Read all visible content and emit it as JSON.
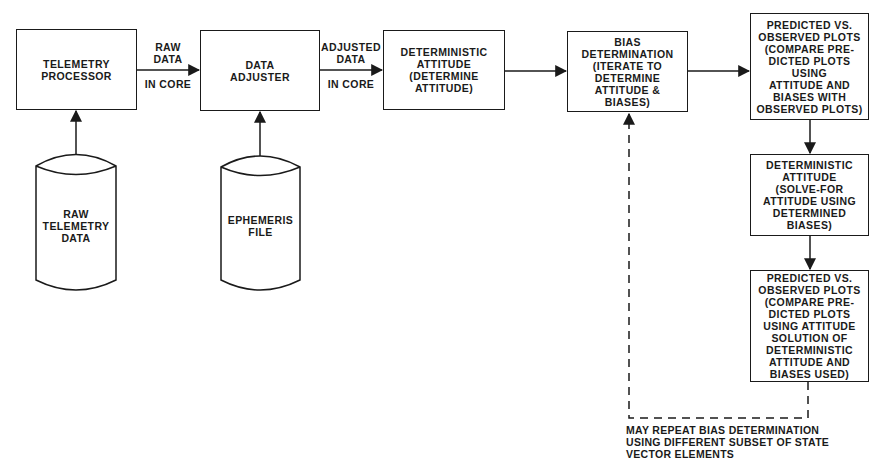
{
  "diagram": {
    "type": "flowchart",
    "nodes": [
      {
        "id": "telemetry_processor",
        "shape": "rect",
        "lines": [
          "TELEMETRY",
          "PROCESSOR"
        ]
      },
      {
        "id": "data_adjuster",
        "shape": "rect",
        "lines": [
          "DATA",
          "ADJUSTER"
        ]
      },
      {
        "id": "deterministic_attitude_1",
        "shape": "rect",
        "lines": [
          "DETERMINISTIC",
          "ATTITUDE",
          "(DETERMINE",
          "ATTITUDE)"
        ]
      },
      {
        "id": "bias_determination",
        "shape": "rect",
        "lines": [
          "BIAS",
          "DETERMINATION",
          "(ITERATE TO",
          "DETERMINE",
          "ATTITUDE &",
          "BIASES)"
        ]
      },
      {
        "id": "predicted_vs_observed_1",
        "shape": "rect",
        "lines": [
          "PREDICTED VS.",
          "OBSERVED PLOTS",
          "(COMPARE PRE-",
          "DICTED PLOTS",
          "USING",
          "ATTITUDE AND",
          "BIASES WITH",
          "OBSERVED PLOTS)"
        ]
      },
      {
        "id": "deterministic_attitude_2",
        "shape": "rect",
        "lines": [
          "DETERMINISTIC",
          "ATTITUDE",
          "(SOLVE-FOR",
          "ATTITUDE USING",
          "DETERMINED",
          "BIASES)"
        ]
      },
      {
        "id": "predicted_vs_observed_2",
        "shape": "rect",
        "lines": [
          "PREDICTED VS.",
          "OBSERVED PLOTS",
          "(COMPARE PRE-",
          "DICTED PLOTS",
          "USING ATTITUDE",
          "SOLUTION OF",
          "DETERMINISTIC",
          "ATTITUDE AND",
          "BIASES USED)"
        ]
      },
      {
        "id": "raw_telemetry_data",
        "shape": "cylinder",
        "lines": [
          "RAW",
          "TELEMETRY",
          "DATA"
        ]
      },
      {
        "id": "ephemeris_file",
        "shape": "cylinder",
        "lines": [
          "EPHEMERIS",
          "FILE"
        ]
      }
    ],
    "edges": [
      {
        "from": "telemetry_processor",
        "to": "data_adjuster",
        "label_above": [
          "RAW",
          "DATA"
        ],
        "label_below": "IN CORE"
      },
      {
        "from": "data_adjuster",
        "to": "deterministic_attitude_1",
        "label_above": [
          "ADJUSTED",
          "DATA"
        ],
        "label_below": "IN CORE"
      },
      {
        "from": "deterministic_attitude_1",
        "to": "bias_determination"
      },
      {
        "from": "bias_determination",
        "to": "predicted_vs_observed_1"
      },
      {
        "from": "predicted_vs_observed_1",
        "to": "deterministic_attitude_2"
      },
      {
        "from": "deterministic_attitude_2",
        "to": "predicted_vs_observed_2"
      },
      {
        "from": "raw_telemetry_data",
        "to": "telemetry_processor"
      },
      {
        "from": "ephemeris_file",
        "to": "data_adjuster"
      },
      {
        "from": "predicted_vs_observed_2",
        "to": "bias_determination",
        "style": "dashed"
      }
    ],
    "note": [
      "MAY REPEAT BIAS DETERMINATION",
      "USING DIFFERENT SUBSET OF STATE",
      "VECTOR ELEMENTS"
    ]
  }
}
